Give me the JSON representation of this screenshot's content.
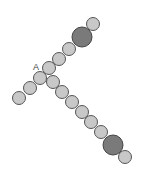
{
  "diagram": {
    "label": "A",
    "label_pos": [
      33,
      70
    ],
    "colors": {
      "small_fill": "#c8c8c8",
      "large_fill": "#7a7a7a",
      "stroke": "#555555"
    },
    "upper_chain": [
      {
        "cx": 19,
        "cy": 98,
        "r": 6.5,
        "type": "small"
      },
      {
        "cx": 30,
        "cy": 88,
        "r": 6.5,
        "type": "small"
      },
      {
        "cx": 40,
        "cy": 78,
        "r": 6.5,
        "type": "small"
      },
      {
        "cx": 49,
        "cy": 68,
        "r": 6.5,
        "type": "small"
      },
      {
        "cx": 59,
        "cy": 59,
        "r": 6.5,
        "type": "small"
      },
      {
        "cx": 69,
        "cy": 49,
        "r": 6.5,
        "type": "small"
      },
      {
        "cx": 82,
        "cy": 37,
        "r": 10,
        "type": "large"
      },
      {
        "cx": 93,
        "cy": 24,
        "r": 6.5,
        "type": "small"
      }
    ],
    "lower_chain": [
      {
        "cx": 53,
        "cy": 82,
        "r": 6.5,
        "type": "small"
      },
      {
        "cx": 62,
        "cy": 92,
        "r": 6.5,
        "type": "small"
      },
      {
        "cx": 72,
        "cy": 102,
        "r": 6.5,
        "type": "small"
      },
      {
        "cx": 82,
        "cy": 112,
        "r": 6.5,
        "type": "small"
      },
      {
        "cx": 91,
        "cy": 122,
        "r": 6.5,
        "type": "small"
      },
      {
        "cx": 101,
        "cy": 132,
        "r": 6.5,
        "type": "small"
      },
      {
        "cx": 113,
        "cy": 145,
        "r": 10,
        "type": "large"
      },
      {
        "cx": 125,
        "cy": 157,
        "r": 6.5,
        "type": "small"
      }
    ]
  }
}
